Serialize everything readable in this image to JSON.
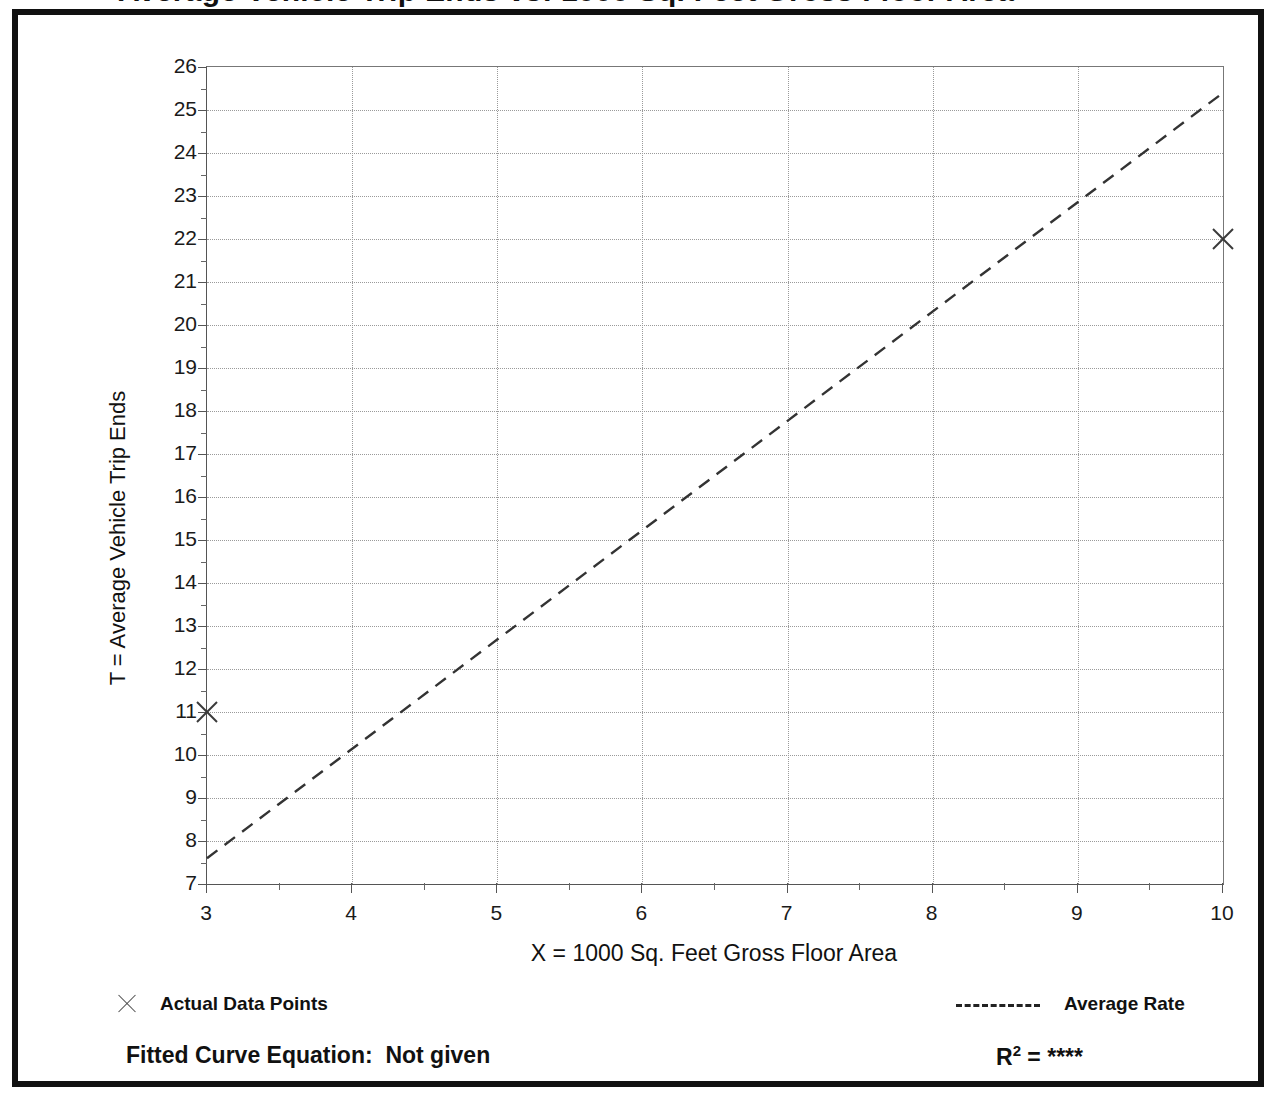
{
  "title_partial": "Average Vehicle Trip Ends vs: 1000 Sq. Feet Gross Floor Area",
  "axes": {
    "y_title": "T = Average Vehicle Trip Ends",
    "x_title": "X = 1000 Sq. Feet Gross Floor Area",
    "y_ticks": [
      7,
      8,
      9,
      10,
      11,
      12,
      13,
      14,
      15,
      16,
      17,
      18,
      19,
      20,
      21,
      22,
      23,
      24,
      25,
      26
    ],
    "x_ticks": [
      3,
      4,
      5,
      6,
      7,
      8,
      9,
      10
    ],
    "y_min": 7,
    "y_max": 26,
    "x_min": 3,
    "x_max": 10,
    "y_minor_step": 0.5,
    "x_minor_step": 0.5
  },
  "legend": {
    "data_points_label": "Actual Data Points",
    "data_points_marker": "x-marker-icon",
    "average_rate_label": "Average Rate",
    "average_rate_marker": "dashed-line-icon"
  },
  "footer": {
    "equation_label": "Fitted Curve Equation:",
    "equation_value": "Not given",
    "r2_label": "R",
    "r2_exponent": "2",
    "r2_equals": "=",
    "r2_value": "****"
  },
  "colors": {
    "frame": "#111111",
    "grid": "#9a9a9a",
    "axis": "#555555",
    "series": "#333333",
    "background": "#ffffff"
  },
  "chart_data": {
    "type": "scatter",
    "title": "Average Vehicle Trip Ends vs: 1000 Sq. Feet Gross Floor Area",
    "xlabel": "X = 1000 Sq. Feet Gross Floor Area",
    "ylabel": "T = Average Vehicle Trip Ends",
    "xlim": [
      3,
      10
    ],
    "ylim": [
      7,
      26
    ],
    "grid": true,
    "legend_position": "below-axes",
    "series": [
      {
        "name": "Actual Data Points",
        "type": "scatter",
        "marker": "x",
        "x": [
          3,
          10
        ],
        "y": [
          11,
          22
        ]
      },
      {
        "name": "Average Rate",
        "type": "line",
        "linestyle": "dashed",
        "x": [
          3,
          10
        ],
        "y": [
          7.6,
          25.4
        ]
      }
    ],
    "annotations": [
      "Fitted Curve Equation:  Not given",
      "R2 = ****"
    ]
  }
}
